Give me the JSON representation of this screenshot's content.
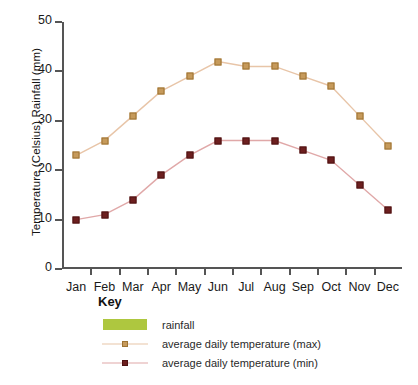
{
  "chart_data": {
    "type": "line",
    "title": "",
    "xlabel": "",
    "ylabel": "Temperature (Celsius)  Rainfall (mm)",
    "ylim": [
      0,
      50
    ],
    "yticks": [
      0,
      10,
      20,
      30,
      40,
      50
    ],
    "grid": false,
    "legend_position": "below-chart",
    "categories": [
      "Jan",
      "Feb",
      "Mar",
      "Apr",
      "May",
      "Jun",
      "Jul",
      "Aug",
      "Sep",
      "Oct",
      "Nov",
      "Dec"
    ],
    "series": [
      {
        "name": "average daily temperature (max)",
        "marker_color": "#c69a5b",
        "line_color": "#e8c5a8",
        "values": [
          23,
          26,
          31,
          36,
          39,
          42,
          41,
          41,
          39,
          37,
          31,
          25
        ]
      },
      {
        "name": "average daily temperature (min)",
        "marker_color": "#6d1f1f",
        "line_color": "#e0a8a8",
        "values": [
          10,
          11,
          14,
          19,
          23,
          26,
          26,
          26,
          24,
          22,
          17,
          12
        ]
      }
    ]
  },
  "axes": {
    "y_title": "Temperature (Celsius)  Rainfall (mm)",
    "y_tick_labels": [
      "0",
      "10",
      "20",
      "30",
      "40",
      "50"
    ],
    "x_tick_labels": [
      "Jan",
      "Feb",
      "Mar",
      "Apr",
      "May",
      "Jun",
      "Jul",
      "Aug",
      "Sep",
      "Oct",
      "Nov",
      "Dec"
    ]
  },
  "key": {
    "title": "Key",
    "entries": [
      {
        "label": "rainfall",
        "style": "swatch",
        "color": "#aec73f"
      },
      {
        "label": "average daily temperature (max)",
        "style": "line",
        "color": "#c69a5b"
      },
      {
        "label": "average daily temperature (min)",
        "style": "line",
        "color": "#6d1f1f"
      }
    ]
  },
  "colors": {
    "rainfall": "#aec73f",
    "temp_max": "#c69a5b",
    "temp_min": "#6d1f1f",
    "axis": "#555555",
    "background": "#ffffff"
  }
}
